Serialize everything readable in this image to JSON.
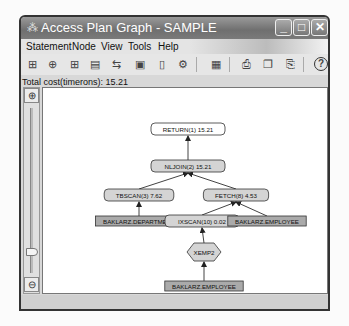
{
  "window": {
    "title": "Access Plan Graph - SAMPLE",
    "app_icon": "db2-plan-icon",
    "controls": {
      "minimize": "_",
      "maximize": "□",
      "close": "✕"
    }
  },
  "menu": [
    {
      "label": "Statement"
    },
    {
      "label": "Node"
    },
    {
      "label": "View"
    },
    {
      "label": "Tools"
    },
    {
      "label": "Help"
    }
  ],
  "toolbar": {
    "buttons": [
      {
        "name": "statement-tree-icon",
        "glyph": "⊞"
      },
      {
        "name": "node-details-icon",
        "glyph": "⊕"
      },
      {
        "name": "node-tree-icon",
        "glyph": "⊞"
      },
      {
        "name": "statistics-icon",
        "glyph": "▤"
      },
      {
        "name": "graph-layout-icon",
        "glyph": "⇆"
      },
      {
        "name": "monitor-icon",
        "glyph": "▣"
      },
      {
        "name": "document-icon",
        "glyph": "▯"
      },
      {
        "name": "settings-tool-icon",
        "glyph": "⚙"
      },
      {
        "name": "window-icon",
        "glyph": "▦"
      },
      {
        "name": "print-icon",
        "glyph": "⎙"
      },
      {
        "name": "copy-icon",
        "glyph": "❐"
      },
      {
        "name": "paste-icon",
        "glyph": "⎘"
      },
      {
        "name": "help-icon",
        "glyph": "?"
      }
    ]
  },
  "total_cost": {
    "label": "Total cost(timerons): 15.21",
    "value": 15.21
  },
  "zoom": {
    "zoom_in": "⊕",
    "zoom_out": "⊖"
  },
  "graph": {
    "nodes": [
      {
        "id": "return",
        "label": "RETURN(1) 15.21",
        "type": "operator",
        "x": 145,
        "y": 41
      },
      {
        "id": "nljoin",
        "label": "NLJOIN(2) 15.21",
        "type": "operator",
        "x": 145,
        "y": 78
      },
      {
        "id": "tbscan",
        "label": "TBSCAN(3) 7.62",
        "type": "operator",
        "x": 96,
        "y": 107
      },
      {
        "id": "fetch",
        "label": "FETCH(8) 4.53",
        "type": "operator",
        "x": 193,
        "y": 107
      },
      {
        "id": "department",
        "label": "BAKLARZ.DEPARTMENT",
        "type": "table",
        "x": 96,
        "y": 133
      },
      {
        "id": "ixscan",
        "label": "IXSCAN(10) 0.02",
        "type": "operator",
        "x": 159,
        "y": 133
      },
      {
        "id": "employee1",
        "label": "BAKLARZ.EMPLOYEE",
        "type": "table",
        "x": 224,
        "y": 133
      },
      {
        "id": "xemp2",
        "label": "XEMP2",
        "type": "index",
        "x": 161,
        "y": 164
      },
      {
        "id": "employee2",
        "label": "BAKLARZ.EMPLOYEE",
        "type": "table",
        "x": 161,
        "y": 198
      }
    ],
    "edges": [
      {
        "from": "nljoin",
        "to": "return"
      },
      {
        "from": "tbscan",
        "to": "nljoin"
      },
      {
        "from": "fetch",
        "to": "nljoin"
      },
      {
        "from": "department",
        "to": "tbscan"
      },
      {
        "from": "ixscan",
        "to": "fetch"
      },
      {
        "from": "employee1",
        "to": "fetch"
      },
      {
        "from": "xemp2",
        "to": "ixscan"
      },
      {
        "from": "employee2",
        "to": "xemp2"
      }
    ]
  }
}
